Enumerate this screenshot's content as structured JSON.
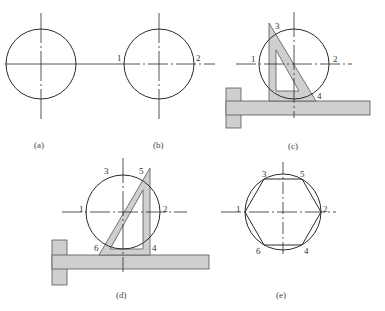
{
  "figure": {
    "panels": [
      {
        "id": "a",
        "caption": "(a)",
        "point_labels": []
      },
      {
        "id": "b",
        "caption": "(b)",
        "point_labels": [
          "1",
          "2"
        ]
      },
      {
        "id": "c",
        "caption": "(c)",
        "point_labels": [
          "1",
          "2",
          "3",
          "4"
        ]
      },
      {
        "id": "d",
        "caption": "(d)",
        "point_labels": [
          "1",
          "2",
          "3",
          "4",
          "5",
          "6"
        ]
      },
      {
        "id": "e",
        "caption": "(e)",
        "point_labels": [
          "1",
          "2",
          "3",
          "4",
          "5",
          "6"
        ]
      }
    ]
  },
  "colors": {
    "line": "#2a2a2a",
    "tool_fill": "#cfcfcf",
    "tool_stroke": "#555555"
  }
}
